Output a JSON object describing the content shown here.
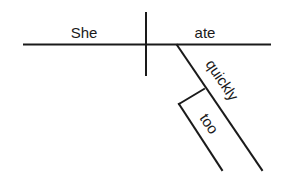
{
  "diagram": {
    "type": "sentence-diagram",
    "words": {
      "subject": "She",
      "verb": "ate",
      "adverb": "quickly",
      "adverb_modifier": "too"
    },
    "colors": {
      "line": "#1a1a1a",
      "background": "#ffffff"
    }
  }
}
